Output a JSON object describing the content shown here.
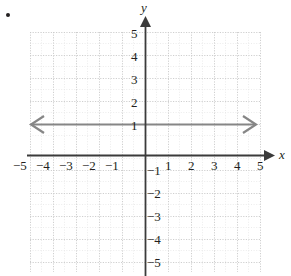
{
  "figure": {
    "bullet": "•",
    "axis_labels": {
      "x": "x",
      "y": "y"
    },
    "x_ticks": [
      {
        "value": -5,
        "label": "−5"
      },
      {
        "value": -4,
        "label": "−4"
      },
      {
        "value": -3,
        "label": "−3"
      },
      {
        "value": -2,
        "label": "−2"
      },
      {
        "value": -1,
        "label": "−1"
      },
      {
        "value": 1,
        "label": "1"
      },
      {
        "value": 2,
        "label": "2"
      },
      {
        "value": 3,
        "label": "3"
      },
      {
        "value": 4,
        "label": "4"
      },
      {
        "value": 5,
        "label": "5"
      }
    ],
    "y_ticks": [
      {
        "value": 5,
        "label": "5"
      },
      {
        "value": 4,
        "label": "4"
      },
      {
        "value": 3,
        "label": "3"
      },
      {
        "value": 2,
        "label": "2"
      },
      {
        "value": 1,
        "label": "1"
      },
      {
        "value": -1,
        "label": "−1"
      },
      {
        "value": -2,
        "label": "−2"
      },
      {
        "value": -3,
        "label": "−3"
      },
      {
        "value": -4,
        "label": "−4"
      },
      {
        "value": -5,
        "label": "−5"
      }
    ],
    "colors": {
      "axis": "#3b3b3b",
      "grid_major": "#cfcfcf",
      "grid_minor": "#e2e2e2",
      "graph_line": "#868686",
      "text": "#231f20",
      "background": "#ffffff"
    }
  },
  "chart_data": {
    "type": "line",
    "title": "",
    "xlabel": "x",
    "ylabel": "y",
    "xlim": [
      -5,
      5
    ],
    "ylim": [
      -5,
      5
    ],
    "grid": true,
    "legend": "none",
    "xticks": [
      -5,
      -4,
      -3,
      -2,
      -1,
      1,
      2,
      3,
      4,
      5
    ],
    "yticks": [
      5,
      4,
      3,
      2,
      1,
      -1,
      -2,
      -3,
      -4,
      -5
    ],
    "series": [
      {
        "name": "y = 1",
        "equation": "y = 1",
        "type": "horizontal-line",
        "constant_y": 1,
        "x": [
          -5,
          5
        ],
        "values": [
          1,
          1
        ],
        "arrows": "both",
        "color": "#868686"
      }
    ],
    "annotations": []
  }
}
